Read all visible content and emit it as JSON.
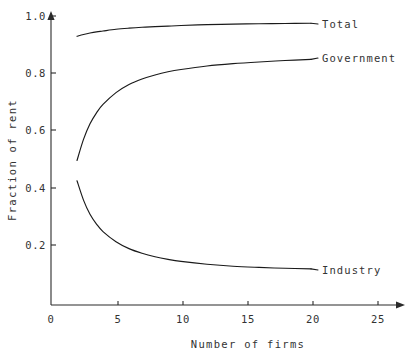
{
  "chart_data": {
    "type": "line",
    "title": "",
    "xlabel": "Number of firms",
    "ylabel": "Fraction of rent",
    "xlim": [
      0,
      26.5
    ],
    "ylim": [
      0,
      1.04
    ],
    "xticks": [
      0,
      5,
      10,
      15,
      20,
      25
    ],
    "xtick_labels": [
      "0",
      "5",
      "10",
      "15",
      "20",
      "25"
    ],
    "yticks": [
      0.2,
      0.4,
      0.6,
      0.8,
      1.0
    ],
    "ytick_labels": [
      "0.2",
      "0.4",
      "0.6",
      "0.8",
      "1.0"
    ],
    "grid": false,
    "legend": "inline-right-of-curve-ends",
    "x": [
      2,
      2.5,
      3,
      3.5,
      4,
      5,
      6,
      7,
      8,
      9,
      10,
      12,
      14,
      16,
      18,
      20
    ],
    "series": [
      {
        "name": "Total",
        "label": "Total",
        "values": [
          0.93,
          0.936,
          0.941,
          0.945,
          0.948,
          0.954,
          0.958,
          0.961,
          0.963,
          0.965,
          0.967,
          0.97,
          0.972,
          0.973,
          0.974,
          0.975
        ]
      },
      {
        "name": "Government",
        "label": "Government",
        "values": [
          0.5,
          0.573,
          0.627,
          0.665,
          0.694,
          0.735,
          0.763,
          0.782,
          0.796,
          0.807,
          0.815,
          0.827,
          0.835,
          0.841,
          0.846,
          0.85
        ]
      },
      {
        "name": "Industry",
        "label": "Industry",
        "values": [
          0.43,
          0.363,
          0.314,
          0.28,
          0.254,
          0.219,
          0.195,
          0.179,
          0.167,
          0.158,
          0.151,
          0.141,
          0.134,
          0.13,
          0.127,
          0.125
        ]
      }
    ]
  },
  "axes": {
    "y_title": "Fraction of rent",
    "x_title": "Number of firms"
  },
  "colors": {
    "curve": "#1a1a1a",
    "axis": "#2b2b2b",
    "text": "#333333",
    "background": "#ffffff"
  }
}
